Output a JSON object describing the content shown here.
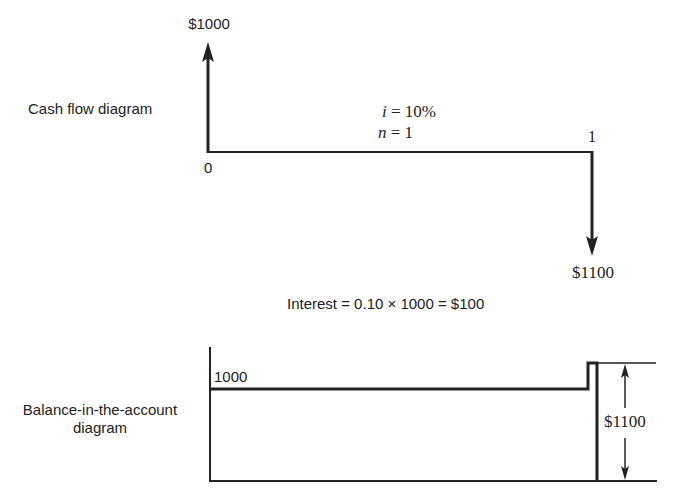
{
  "cash_flow": {
    "title": "Cash flow diagram",
    "inflow_label": "$1000",
    "outflow_label": "$1100",
    "period_start": "0",
    "period_end": "1",
    "rate_var": "i",
    "rate_eq": " = 10%",
    "n_var": "n",
    "n_eq": " = 1"
  },
  "interest": {
    "formula": "Interest = 0.10 × 1000 = $100"
  },
  "balance": {
    "title_line1": "Balance-in-the-account",
    "title_line2": "diagram",
    "start_value": "1000",
    "end_value": "$1100"
  },
  "colors": {
    "ink": "#222222",
    "background": "#ffffff"
  }
}
